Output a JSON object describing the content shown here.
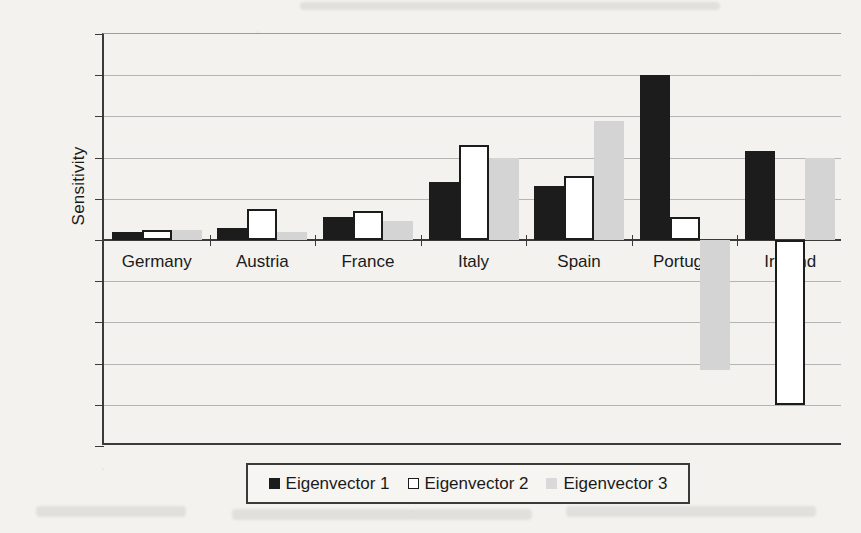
{
  "chart_data": {
    "type": "bar",
    "title": "",
    "xlabel": "",
    "ylabel": "Sensitivity",
    "categories": [
      "Germany",
      "Austria",
      "France",
      "Italy",
      "Spain",
      "Portugal",
      "Ireland"
    ],
    "series": [
      {
        "name": "Eigenvector 1",
        "color": "#1c1c1c",
        "style": "filled-black",
        "values": [
          0.04,
          0.06,
          0.11,
          0.28,
          0.26,
          0.8,
          0.43
        ]
      },
      {
        "name": "Eigenvector 2",
        "color": "#ffffff",
        "style": "white-outline",
        "values": [
          0.05,
          0.15,
          0.14,
          0.46,
          0.31,
          0.11,
          -0.8
        ]
      },
      {
        "name": "Eigenvector 3",
        "color": "#d4d4d4",
        "style": "light-gray",
        "values": [
          0.05,
          0.04,
          0.09,
          0.4,
          0.58,
          -0.63,
          0.4
        ]
      }
    ],
    "ylim": [
      -1,
      1
    ],
    "ytick_values": [
      1,
      0.8,
      0.6,
      0.4,
      0.2,
      0,
      -0.2,
      -0.4,
      -0.6,
      -0.8,
      -1
    ],
    "ytick_labels": [
      "1",
      "0.8",
      "0.6",
      "0.4",
      "0.2",
      "0",
      "0.2",
      "0.4",
      "0.6",
      "0.8",
      "1"
    ],
    "grid": true,
    "legend_position": "bottom"
  },
  "legend": {
    "entries": [
      "Eigenvector 1",
      "Eigenvector 2",
      "Eigenvector 3"
    ]
  }
}
